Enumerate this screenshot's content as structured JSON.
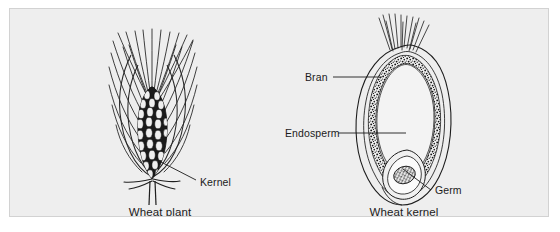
{
  "figure": {
    "background_color": "#eeeeee",
    "frame_color": "#d2d2d2",
    "ink_color": "#1b1b1b",
    "page_color": "#ffffff",
    "panels": [
      {
        "id": "wheat-plant",
        "caption": "Wheat plant",
        "labels": [
          {
            "id": "kernel",
            "text": "Kernel"
          }
        ]
      },
      {
        "id": "wheat-kernel",
        "caption": "Wheat kernel",
        "labels": [
          {
            "id": "bran",
            "text": "Bran"
          },
          {
            "id": "endosperm",
            "text": "Endosperm"
          },
          {
            "id": "germ",
            "text": "Germ"
          }
        ]
      }
    ]
  },
  "captions": {
    "wheat_plant": "Wheat plant",
    "wheat_kernel": "Wheat kernel"
  },
  "labels": {
    "kernel": "Kernel",
    "bran": "Bran",
    "endosperm": "Endosperm",
    "germ": "Germ"
  }
}
